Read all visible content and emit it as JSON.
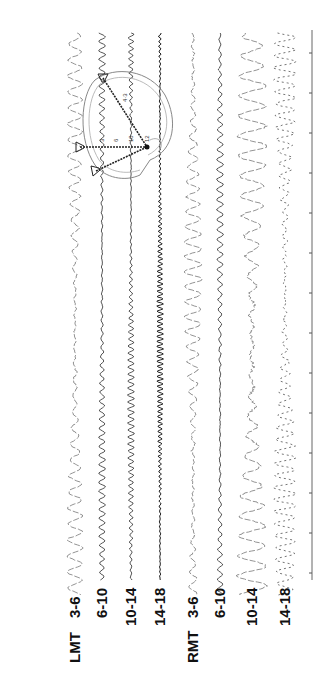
{
  "chart_data": {
    "type": "line",
    "orientation": "rotated-90",
    "title": "",
    "series": [
      {
        "name": "LMT 3-6",
        "group": "LMT",
        "band": "3-6",
        "x": 75,
        "amp": 7,
        "period": 16,
        "style": "faint-large"
      },
      {
        "name": "LMT 6-10",
        "group": "LMT",
        "band": "6-10",
        "x": 102,
        "amp": 3,
        "period": 9,
        "style": "solid-small"
      },
      {
        "name": "LMT 10-14",
        "group": "LMT",
        "band": "10-14",
        "x": 131,
        "amp": 3,
        "period": 7,
        "style": "solid-small"
      },
      {
        "name": "LMT 14-18",
        "group": "LMT",
        "band": "14-18",
        "x": 160,
        "amp": 3,
        "period": 5,
        "style": "solid-dark"
      },
      {
        "name": "RMT 3-6",
        "group": "RMT",
        "band": "3-6",
        "x": 193,
        "amp": 8,
        "period": 15,
        "style": "faint-large"
      },
      {
        "name": "RMT 6-10",
        "group": "RMT",
        "band": "6-10",
        "x": 220,
        "amp": 3,
        "period": 10,
        "style": "solid-small"
      },
      {
        "name": "RMT 10-14",
        "group": "RMT",
        "band": "10-14",
        "x": 252,
        "amp": 13,
        "period": 20,
        "style": "faint-large"
      },
      {
        "name": "RMT 14-18",
        "group": "RMT",
        "band": "14-18",
        "x": 285,
        "amp": 10,
        "period": 12,
        "style": "faint-dotted"
      }
    ],
    "labels": {
      "groups": [
        "LMT",
        "RMT"
      ],
      "bands": [
        "3-6",
        "6-10",
        "10-14",
        "14-18"
      ]
    },
    "time_axis": {
      "x": 312,
      "y_start": 30,
      "y_end": 580,
      "tick_start": 53,
      "tick_spacing": 40,
      "tick_count": 14
    },
    "head_diagram": {
      "electrode_labels": [
        "3",
        "6",
        "10",
        "12",
        "4",
        "3"
      ]
    }
  },
  "labels": {
    "lmt": "LMT",
    "rmt": "RMT",
    "b1": "3-6",
    "b2": "6-10",
    "b3": "10-14",
    "b4": "14-18"
  }
}
